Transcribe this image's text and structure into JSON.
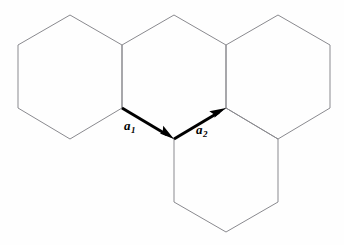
{
  "figure": {
    "background_color": "#fefefe",
    "hex_stroke_color": "#8a8a8f",
    "vector_color": "#000000"
  },
  "labels": {
    "a1": {
      "symbol": "a",
      "subscript": "1"
    },
    "a2": {
      "symbol": "a",
      "subscript": "2"
    }
  },
  "chart_data": {
    "type": "diagram",
    "xlabel": "",
    "ylabel": "",
    "grid": false,
    "legend": "none",
    "units": "pixels",
    "hexagons": [
      {
        "name": "upper-left-hexagon",
        "center": [
          70,
          77
        ],
        "vertices": [
          [
            18,
            45
          ],
          [
            70,
            15
          ],
          [
            122,
            45
          ],
          [
            122,
            108
          ],
          [
            70,
            139
          ],
          [
            18,
            108
          ]
        ]
      },
      {
        "name": "upper-middle-hexagon",
        "center": [
          174,
          77
        ],
        "vertices": [
          [
            122,
            45
          ],
          [
            174,
            15
          ],
          [
            226,
            45
          ],
          [
            226,
            108
          ],
          [
            174,
            139
          ],
          [
            122,
            108
          ]
        ]
      },
      {
        "name": "upper-right-hexagon",
        "center": [
          278,
          77
        ],
        "vertices": [
          [
            226,
            45
          ],
          [
            278,
            15
          ],
          [
            330,
            45
          ],
          [
            330,
            108
          ],
          [
            278,
            139
          ],
          [
            226,
            108
          ]
        ]
      },
      {
        "name": "lower-middle-hexagon",
        "center": [
          226,
          171
        ],
        "vertices": [
          [
            174,
            139
          ],
          [
            226,
            108
          ],
          [
            278,
            139
          ],
          [
            278,
            202
          ],
          [
            226,
            232
          ],
          [
            174,
            202
          ]
        ]
      }
    ],
    "vectors": [
      {
        "name": "a1",
        "label": "a1",
        "start": [
          122,
          108
        ],
        "end": [
          174,
          139
        ],
        "direction_degrees": -30,
        "label_position": [
          133,
          128
        ]
      },
      {
        "name": "a2",
        "label": "a2",
        "start": [
          174,
          139
        ],
        "end": [
          226,
          108
        ],
        "direction_degrees": 30,
        "label_position": [
          205,
          132
        ]
      }
    ]
  }
}
